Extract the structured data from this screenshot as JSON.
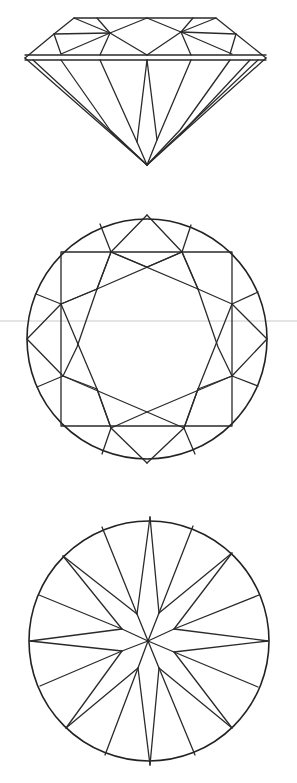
{
  "figure": {
    "views": [
      {
        "id": "side-view",
        "label": "Side (profile) view"
      },
      {
        "id": "crown-view",
        "label": "Top (crown) view"
      },
      {
        "id": "pavilion-view",
        "label": "Bottom (pavilion) view"
      }
    ],
    "colors": {
      "line": "#2a2a2a",
      "background": "#ffffff"
    }
  }
}
